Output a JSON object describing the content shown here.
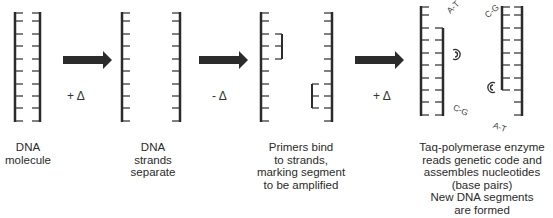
{
  "diagram": {
    "colors": {
      "strand": "#2b2b2b",
      "rung": "#3a3a3a",
      "arrow": "#2b2b2b",
      "text": "#2a2a2a"
    },
    "steps": [
      {
        "caption": "DNA\nmolecule"
      },
      {
        "caption": "DNA\nstrands\nseparate"
      },
      {
        "caption": "Primers bind\nto strands,\nmarking segment\nto be amplified"
      },
      {
        "caption": "Taq-polymerase enzyme\nreads genetic code and\nassembles nucleotides\n(base pairs)\nNew DNA segments\nare formed"
      }
    ],
    "transitions": [
      {
        "label": "+ Δ"
      },
      {
        "label": "- Δ"
      },
      {
        "label": "+ Δ"
      }
    ],
    "base_pair_labels": [
      "A-T",
      "C-G",
      "C-G",
      "A-T"
    ],
    "enzyme_glyphs": [
      "polymerase-1",
      "polymerase-2"
    ]
  }
}
